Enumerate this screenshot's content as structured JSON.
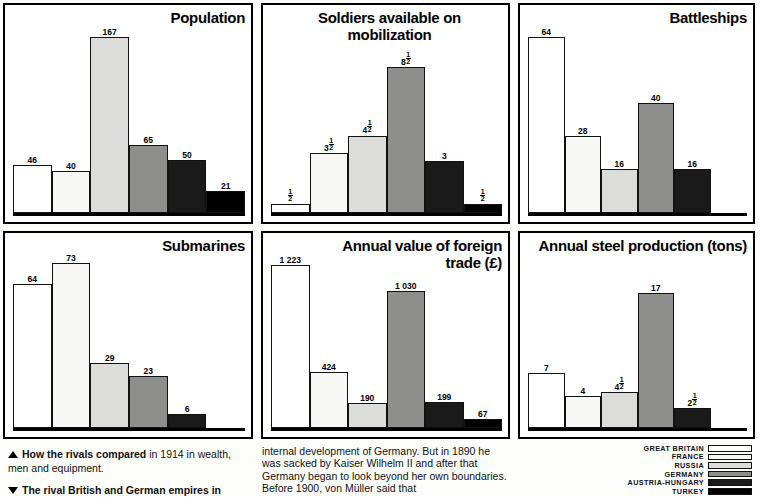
{
  "legend": {
    "items": [
      {
        "label": "GREAT BRITAIN",
        "key": "gb",
        "color": "#ffffff"
      },
      {
        "label": "FRANCE",
        "key": "fr",
        "color": "#f7f7f5"
      },
      {
        "label": "RUSSIA",
        "key": "ru",
        "color": "#dcdcda"
      },
      {
        "label": "GERMANY",
        "key": "de",
        "color": "#8e8e8c"
      },
      {
        "label": "AUSTRIA-HUNGARY",
        "key": "au",
        "color": "#1a1a1a"
      },
      {
        "label": "TURKEY",
        "key": "tr",
        "color": "#000000"
      }
    ]
  },
  "captions": {
    "caption_one_bold": "How the rivals compared",
    "caption_one_rest": " in 1914 in wealth, men and equipment.",
    "caption_two_bold": "The rival British and German empires in",
    "body_text": "internal development of Germany. But in 1890 he was sacked by Kaiser Wilhelm II and after that Germany began to look beyond her own boundaries. Before 1900, von Müller said that"
  },
  "chart_data": [
    {
      "id": "population",
      "type": "bar",
      "title": "Population",
      "xlabel": "",
      "ylabel": "",
      "ylim": [
        0,
        167
      ],
      "categories": [
        "GREAT BRITAIN",
        "FRANCE",
        "RUSSIA",
        "GERMANY",
        "AUSTRIA-HUNGARY",
        "TURKEY"
      ],
      "values": [
        46,
        40,
        167,
        65,
        50,
        21
      ],
      "labels": [
        "46",
        "40",
        "167",
        "65",
        "50",
        "21"
      ],
      "series": [
        {
          "name": "Population (millions)",
          "values": [
            46,
            40,
            167,
            65,
            50,
            21
          ]
        }
      ]
    },
    {
      "id": "soldiers",
      "type": "bar",
      "title": "Soldiers available on mobilization",
      "xlabel": "",
      "ylabel": "",
      "ylim": [
        0,
        8.5
      ],
      "categories": [
        "GREAT BRITAIN",
        "FRANCE",
        "RUSSIA",
        "GERMANY",
        "AUSTRIA-HUNGARY",
        "TURKEY"
      ],
      "values": [
        0.5,
        3.5,
        4.5,
        8.5,
        3,
        0.5
      ],
      "labels": [
        "1/2",
        "3 1/2",
        "4 1/2",
        "8 1/2",
        "3",
        "1/2"
      ],
      "series": [
        {
          "name": "Soldiers (millions)",
          "values": [
            0.5,
            3.5,
            4.5,
            8.5,
            3,
            0.5
          ]
        }
      ]
    },
    {
      "id": "battleships",
      "type": "bar",
      "title": "Battleships",
      "xlabel": "",
      "ylabel": "",
      "ylim": [
        0,
        64
      ],
      "categories": [
        "GREAT BRITAIN",
        "FRANCE",
        "RUSSIA",
        "GERMANY",
        "AUSTRIA-HUNGARY"
      ],
      "values": [
        64,
        28,
        16,
        40,
        16
      ],
      "labels": [
        "64",
        "28",
        "16",
        "40",
        "16"
      ],
      "series": [
        {
          "name": "Battleships",
          "values": [
            64,
            28,
            16,
            40,
            16
          ]
        }
      ]
    },
    {
      "id": "submarines",
      "type": "bar",
      "title": "Submarines",
      "xlabel": "",
      "ylabel": "",
      "ylim": [
        0,
        73
      ],
      "categories": [
        "GREAT BRITAIN",
        "FRANCE",
        "RUSSIA",
        "GERMANY",
        "AUSTRIA-HUNGARY"
      ],
      "values": [
        64,
        73,
        29,
        23,
        6
      ],
      "labels": [
        "64",
        "73",
        "29",
        "23",
        "6"
      ],
      "series": [
        {
          "name": "Submarines",
          "values": [
            64,
            73,
            29,
            23,
            6
          ]
        }
      ]
    },
    {
      "id": "trade",
      "type": "bar",
      "title": "Annual value of foreign trade (£)",
      "xlabel": "",
      "ylabel": "",
      "ylim": [
        0,
        1223
      ],
      "categories": [
        "GREAT BRITAIN",
        "FRANCE",
        "RUSSIA",
        "GERMANY",
        "AUSTRIA-HUNGARY",
        "TURKEY"
      ],
      "values": [
        1223,
        424,
        190,
        1030,
        199,
        67
      ],
      "labels": [
        "1 223",
        "424",
        "190",
        "1 030",
        "199",
        "67"
      ],
      "series": [
        {
          "name": "Foreign trade (£ millions)",
          "values": [
            1223,
            424,
            190,
            1030,
            199,
            67
          ]
        }
      ]
    },
    {
      "id": "steel",
      "type": "bar",
      "title": "Annual steel production (tons)",
      "xlabel": "",
      "ylabel": "",
      "ylim": [
        0,
        17
      ],
      "categories": [
        "GREAT BRITAIN",
        "FRANCE",
        "RUSSIA",
        "GERMANY",
        "AUSTRIA-HUNGARY"
      ],
      "values": [
        7,
        4,
        4.5,
        17,
        2.5
      ],
      "labels": [
        "7",
        "4",
        "4 1/2",
        "17",
        "2 1/2"
      ],
      "series": [
        {
          "name": "Steel production (million tons)",
          "values": [
            7,
            4,
            4.5,
            17,
            2.5
          ]
        }
      ]
    }
  ]
}
